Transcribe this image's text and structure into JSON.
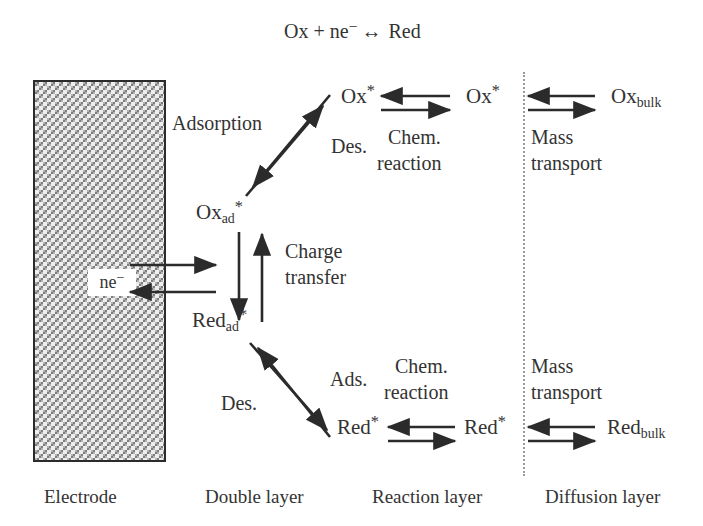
{
  "diagram": {
    "title_equation": {
      "ox": "Ox",
      "plus": "+",
      "electrons": "ne",
      "electron_charge": "−",
      "equilibrium": "↔",
      "red": "Red"
    },
    "electrode": {
      "electron_label": "ne",
      "electron_charge": "−"
    },
    "species": {
      "ox_ad": {
        "base": "Ox",
        "sub": "ad",
        "sup": "*"
      },
      "red_ad": {
        "base": "Red",
        "sub": "ad",
        "sup": "*"
      },
      "ox_star_inner": {
        "base": "Ox",
        "sup": "*"
      },
      "ox_star_outer": {
        "base": "Ox",
        "sup": "*"
      },
      "ox_bulk": {
        "base": "Ox",
        "sub": "bulk"
      },
      "red_star_inner": {
        "base": "Red",
        "sup": "*"
      },
      "red_star_outer": {
        "base": "Red",
        "sup": "*"
      },
      "red_bulk": {
        "base": "Red",
        "sub": "bulk"
      }
    },
    "processes": {
      "adsorption": "Adsorption",
      "desorption_top": "Des.",
      "desorption_bottom": "Des.",
      "adsorption_bottom": "Ads.",
      "charge_transfer_line1": "Charge",
      "charge_transfer_line2": "transfer",
      "chem_reaction_top_line1": "Chem.",
      "chem_reaction_top_line2": "reaction",
      "chem_reaction_bottom_line1": "Chem.",
      "chem_reaction_bottom_line2": "reaction",
      "mass_transport_top_line1": "Mass",
      "mass_transport_top_line2": "transport",
      "mass_transport_bottom_line1": "Mass",
      "mass_transport_bottom_line2": "transport"
    },
    "captions": {
      "electrode": "Electrode",
      "double_layer": "Double layer",
      "reaction_layer": "Reaction layer",
      "diffusion_layer": "Diffusion layer"
    },
    "colors": {
      "ink": "#333333",
      "arrow": "#2b2b2b",
      "electrode_border": "#2b2b2b",
      "electrode_fill": "#b4b4b4",
      "dotted_line": "#9a9a9a",
      "background": "#ffffff"
    }
  }
}
